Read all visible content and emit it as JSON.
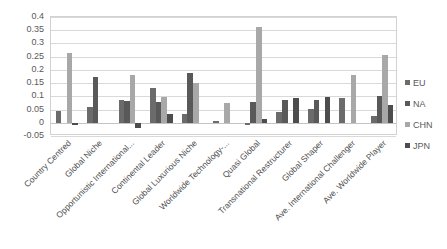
{
  "chart_data": {
    "type": "bar",
    "title": "",
    "subtitle": "",
    "xlabel": "",
    "ylabel": "",
    "ylim": [
      -0.05,
      0.4
    ],
    "ytick_labels": [
      "0.4",
      "0.35",
      "0.3",
      "0.25",
      "0.2",
      "0.15",
      "0.1",
      "0.05",
      "0",
      "-0.05"
    ],
    "ytick_values": [
      0.4,
      0.35,
      0.3,
      0.25,
      0.2,
      0.15,
      0.1,
      0.05,
      0,
      -0.05
    ],
    "grid": true,
    "grid_axis": "y",
    "legend_position": "right",
    "categories": [
      "Country Centred",
      "Global Niche",
      "Opportunistic International...",
      "Continental Leader",
      "Global Luxurious Niche",
      "Worldwide Technology-...",
      "Quasi Global",
      "Transnational Restructurer",
      "Global Shaper",
      "Ave. International Challenger",
      "Ave. Worldwide Player"
    ],
    "series": [
      {
        "name": "EU",
        "color": "#6b6b6b",
        "values": [
          0.045,
          0.06,
          0.088,
          0.132,
          0.035,
          0.008,
          -0.01,
          0.042,
          0.053,
          0.093,
          0.027
        ]
      },
      {
        "name": "NA",
        "color": "#595959",
        "values": [
          0.0,
          0.172,
          0.082,
          0.078,
          0.188,
          0.0,
          0.077,
          0.086,
          0.086,
          0.0,
          0.102
        ]
      },
      {
        "name": "CHN",
        "color": "#a8a8a8",
        "values": [
          0.262,
          0.0,
          0.182,
          0.097,
          0.15,
          0.075,
          0.363,
          0.0,
          0.0,
          0.182,
          0.255
        ]
      },
      {
        "name": "JPN",
        "color": "#4d4d4d",
        "values": [
          -0.01,
          0.0,
          -0.02,
          0.033,
          0.0,
          0.0,
          0.013,
          0.092,
          0.096,
          0.0,
          0.068
        ]
      }
    ]
  },
  "legend": {
    "entries": [
      {
        "label": "EU",
        "color": "#6b6b6b"
      },
      {
        "label": "NA",
        "color": "#595959"
      },
      {
        "label": "CHN",
        "color": "#a8a8a8"
      },
      {
        "label": "JPN",
        "color": "#4d4d4d"
      }
    ]
  },
  "colors": {
    "background": "#ffffff",
    "gridline": "#d9d9d9",
    "plot_border": "#d2d2d2",
    "text": "#595959"
  }
}
